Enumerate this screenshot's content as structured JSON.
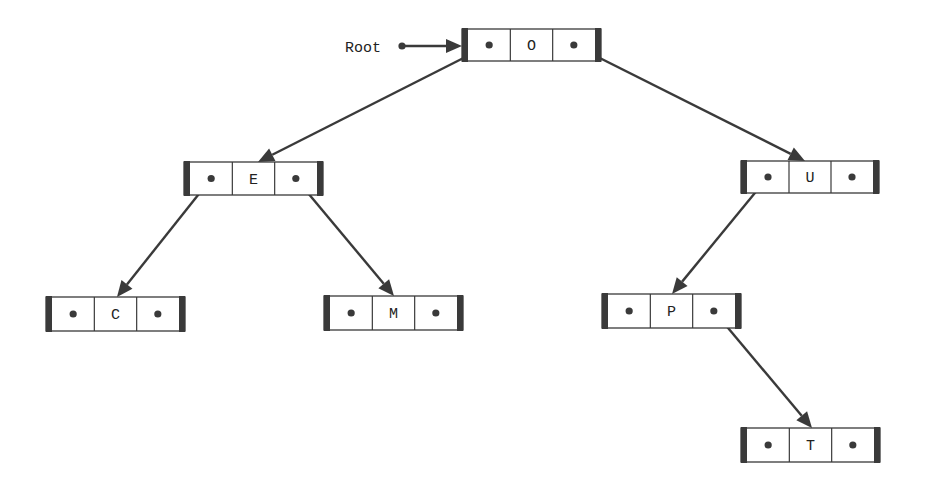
{
  "diagram": {
    "type": "binary-search-tree",
    "root_label": "Root",
    "colors": {
      "line": "#3a3a3a",
      "box_border": "#3a3a3a",
      "end_bar": "#3a3a3a",
      "fill": "#ffffff",
      "text": "#222222"
    },
    "nodes": [
      {
        "id": "O",
        "label": "O",
        "x": 462,
        "y": 29,
        "w": 139,
        "h": 32,
        "left": "E",
        "right": "U"
      },
      {
        "id": "E",
        "label": "E",
        "x": 184,
        "y": 162,
        "w": 139,
        "h": 33,
        "left": "C",
        "right": "M"
      },
      {
        "id": "U",
        "label": "U",
        "x": 741,
        "y": 161,
        "w": 138,
        "h": 32,
        "left": "P",
        "right": null
      },
      {
        "id": "C",
        "label": "C",
        "x": 46,
        "y": 297,
        "w": 139,
        "h": 34,
        "left": null,
        "right": null
      },
      {
        "id": "M",
        "label": "M",
        "x": 324,
        "y": 296,
        "w": 139,
        "h": 34,
        "left": null,
        "right": null
      },
      {
        "id": "P",
        "label": "P",
        "x": 602,
        "y": 294,
        "w": 139,
        "h": 34,
        "left": null,
        "right": "T"
      },
      {
        "id": "T",
        "label": "T",
        "x": 741,
        "y": 428,
        "w": 139,
        "h": 34,
        "left": null,
        "right": null
      }
    ],
    "edges": [
      {
        "from": "O",
        "side": "left",
        "to": "E",
        "tip": [
          258,
          162
        ]
      },
      {
        "from": "O",
        "side": "right",
        "to": "U",
        "tip": [
          805,
          161
        ]
      },
      {
        "from": "E",
        "side": "left",
        "to": "C",
        "tip": [
          117,
          297
        ]
      },
      {
        "from": "E",
        "side": "right",
        "to": "M",
        "tip": [
          394,
          296
        ]
      },
      {
        "from": "U",
        "side": "left",
        "to": "P",
        "tip": [
          672,
          294
        ]
      },
      {
        "from": "P",
        "side": "right",
        "to": "T",
        "tip": [
          812,
          428
        ]
      }
    ],
    "root_pointer": {
      "label_x": 345,
      "label_y": 52,
      "dot": [
        402,
        46
      ],
      "tip": [
        462,
        46
      ]
    }
  }
}
